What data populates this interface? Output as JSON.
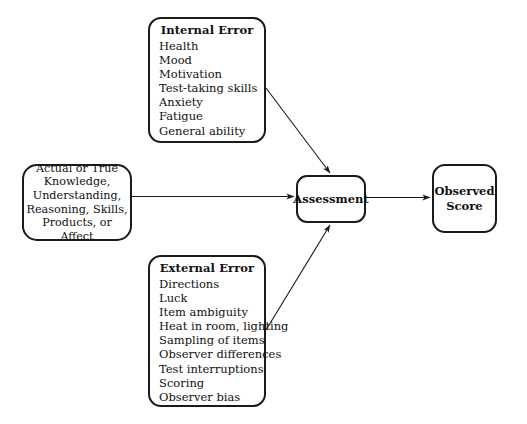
{
  "diagram": {
    "title_visible": false,
    "stroke_color": "#1a1a1a",
    "background_color": "#ffffff",
    "nodes": {
      "internal_error": {
        "title": "Internal Error",
        "items": [
          "Health",
          "Mood",
          "Motivation",
          "Test-taking skills",
          "Anxiety",
          "Fatigue",
          "General ability"
        ]
      },
      "external_error": {
        "title": "External Error",
        "items": [
          "Directions",
          "Luck",
          "Item ambiguity",
          "Heat in room, lighting",
          "Sampling of items",
          "Observer differences",
          "Test interruptions",
          "Scoring",
          "Observer bias"
        ]
      },
      "true_knowledge": {
        "lines": [
          "Actual or True",
          "Knowledge,",
          "Understanding,",
          "Reasoning, Skills,",
          "Products, or Affect"
        ]
      },
      "assessment": {
        "label": "Assessment"
      },
      "observed_score": {
        "lines": [
          "Observed",
          "Score"
        ]
      }
    },
    "arrows": [
      {
        "name": "true-knowledge-to-assessment",
        "from": "true_knowledge",
        "to": "assessment",
        "style": "straight-horizontal"
      },
      {
        "name": "internal-error-to-assessment",
        "from": "internal_error",
        "to": "assessment",
        "style": "diagonal-down-right"
      },
      {
        "name": "external-error-to-assessment",
        "from": "external_error",
        "to": "assessment",
        "style": "diagonal-up-right"
      },
      {
        "name": "assessment-to-observed-score",
        "from": "assessment",
        "to": "observed_score",
        "style": "straight-horizontal"
      }
    ]
  }
}
